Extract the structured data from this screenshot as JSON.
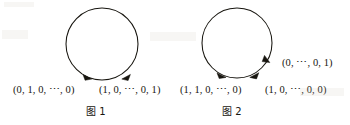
{
  "page": {
    "background_color": "#ffffff",
    "ink_color": "#17150f",
    "width": 350,
    "height": 125
  },
  "figures": [
    {
      "id": "fig1",
      "caption": "图 1",
      "circle": {
        "cx": 102,
        "cy": 44,
        "r": 36
      },
      "vertices": [
        {
          "name": "vertex-f1-left",
          "label": "(0, 1, 0, ⋯, 0)"
        },
        {
          "name": "vertex-f1-right",
          "label": "(1, 0, ⋯, 0, 1)"
        }
      ],
      "arrowheads": [
        {
          "name": "arrowhead-f1-left",
          "angle_deg": 108,
          "direction": "clockwise"
        },
        {
          "name": "arrowhead-f1-right",
          "angle_deg": 72,
          "direction": "clockwise"
        }
      ]
    },
    {
      "id": "fig2",
      "caption": "图 2",
      "circle": {
        "cx": 237,
        "cy": 43,
        "r": 35
      },
      "vertices": [
        {
          "name": "vertex-f2-left",
          "label": "(1, 1, 0, ⋯, 0)"
        },
        {
          "name": "vertex-f2-bottom",
          "label": "(1, 0, ⋯, 0, 0)"
        },
        {
          "name": "vertex-f2-right",
          "label": "(0, ⋯, 0, 1)"
        }
      ],
      "arrowheads": [
        {
          "name": "arrowhead-f2-left",
          "angle_deg": 110,
          "direction": "clockwise"
        },
        {
          "name": "arrowhead-f2-bottom",
          "angle_deg": 68,
          "direction": "clockwise"
        },
        {
          "name": "arrowhead-f2-right",
          "angle_deg": 26,
          "direction": "clockwise"
        }
      ]
    }
  ]
}
